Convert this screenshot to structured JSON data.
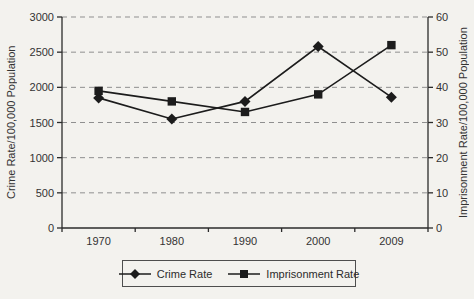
{
  "page": {
    "background": "#f3f2ee"
  },
  "chart_data": {
    "type": "line",
    "title": "",
    "categories": [
      "1970",
      "1980",
      "1990",
      "2000",
      "2009"
    ],
    "series": [
      {
        "name": "Crime Rate",
        "axis": "left",
        "marker": "diamond",
        "color": "#1c1c1c",
        "values": [
          1850,
          1550,
          1800,
          2580,
          1860
        ]
      },
      {
        "name": "Imprisonment Rate",
        "axis": "right",
        "marker": "square",
        "color": "#1c1c1c",
        "values": [
          39,
          36,
          33,
          38,
          52
        ]
      }
    ],
    "axes": {
      "left": {
        "label": "Crime Rate/100,000 Population",
        "min": 0,
        "max": 3000,
        "step": 500,
        "ticks": [
          "0",
          "500",
          "1000",
          "1500",
          "2000",
          "2500",
          "3000"
        ]
      },
      "right": {
        "label": "Imprisonment Rate/100,000 Population",
        "min": 0,
        "max": 60,
        "step": 10,
        "ticks": [
          "0",
          "10",
          "20",
          "30",
          "40",
          "50",
          "60"
        ]
      }
    },
    "grid": {
      "show": true,
      "style": "dashed",
      "color": "#8f8f8f"
    },
    "legend": {
      "position": "bottom",
      "entries": [
        "Crime Rate",
        "Imprisonment Rate"
      ]
    }
  }
}
